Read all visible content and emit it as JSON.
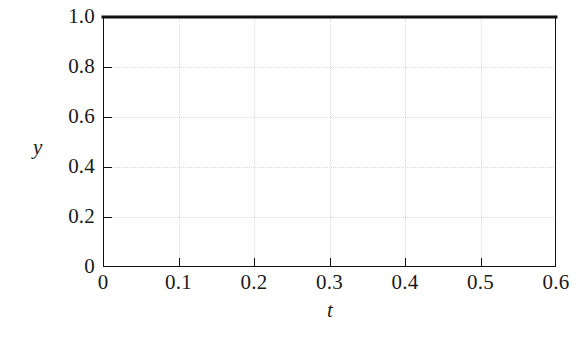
{
  "chart_data": {
    "type": "line",
    "title": "",
    "subtitle": "",
    "xlabel": "t",
    "ylabel": "y",
    "xlim": [
      0,
      0.6
    ],
    "ylim": [
      0,
      1.0
    ],
    "grid": true,
    "legend": null,
    "x_ticks": [
      0,
      0.1,
      0.2,
      0.3,
      0.4,
      0.5,
      0.6
    ],
    "x_tick_labels": [
      "0",
      "0.1",
      "0.2",
      "0.3",
      "0.4",
      "0.5",
      "0.6"
    ],
    "y_ticks": [
      0,
      0.2,
      0.4,
      0.6,
      0.8,
      1.0
    ],
    "y_tick_labels": [
      "0",
      "0.2",
      "0.4",
      "0.6",
      "0.8",
      "1.0"
    ],
    "series": [
      {
        "name": "y(t)",
        "color": "#111111",
        "linewidth": 3,
        "x": [
          0,
          0.1,
          0.2,
          0.3,
          0.4,
          0.5,
          0.6
        ],
        "values": [
          1.0,
          1.0,
          1.0,
          1.0,
          1.0,
          1.0,
          1.0
        ]
      }
    ],
    "annotations": []
  },
  "style": {
    "background": "#ffffff",
    "axis_color": "#111111",
    "grid_color": "#d9d9d9",
    "text_color": "#1a1a1a"
  }
}
